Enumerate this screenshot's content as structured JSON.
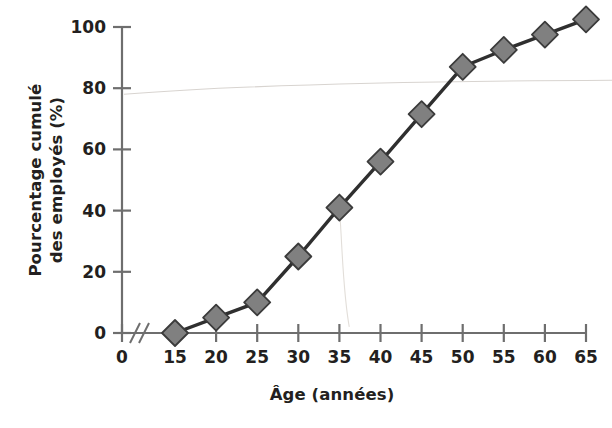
{
  "chart_data": {
    "type": "line",
    "title": "",
    "subtitle": "",
    "xlabel": "Âge (années)",
    "ylabel_line1": "Pourcentage cumulé",
    "ylabel_line2": "des employés (%)",
    "ylabel": "Pourcentage cumulé des employés (%)",
    "x": [
      15,
      20,
      25,
      30,
      35,
      40,
      45,
      50,
      55,
      60,
      65
    ],
    "values": [
      0,
      5,
      10,
      25,
      41,
      56,
      71.5,
      87,
      92.5,
      97.5,
      102.5
    ],
    "series": [
      {
        "name": "Pourcentage cumulé des employés",
        "x": [
          15,
          20,
          25,
          30,
          35,
          40,
          45,
          50,
          55,
          60,
          65
        ],
        "values": [
          0,
          5,
          10,
          25,
          41,
          56,
          71.5,
          87,
          92.5,
          97.5,
          102.5
        ]
      }
    ],
    "xticks": [
      0,
      15,
      20,
      25,
      30,
      35,
      40,
      45,
      50,
      55,
      60,
      65
    ],
    "xticklabels": [
      "0",
      "15",
      "20",
      "25",
      "30",
      "35",
      "40",
      "45",
      "50",
      "55",
      "60",
      "65"
    ],
    "yticks": [
      0,
      20,
      40,
      60,
      80,
      100
    ],
    "yticklabels": [
      "0",
      "20",
      "40",
      "60",
      "80",
      "100"
    ],
    "xlim": [
      0,
      65
    ],
    "ylim": [
      0,
      105
    ],
    "grid": false,
    "legend": false,
    "legend_position": "none",
    "axis_break": {
      "present": true,
      "between": [
        0,
        15
      ],
      "symbol": "//"
    },
    "marker": "diamond",
    "marker_fill": "#808080",
    "marker_edge": "#3b3b3b",
    "line_color": "#2f2f2f",
    "axis_color": "#6e6e6e",
    "text_color": "#231f20",
    "background": "#ffffff"
  }
}
